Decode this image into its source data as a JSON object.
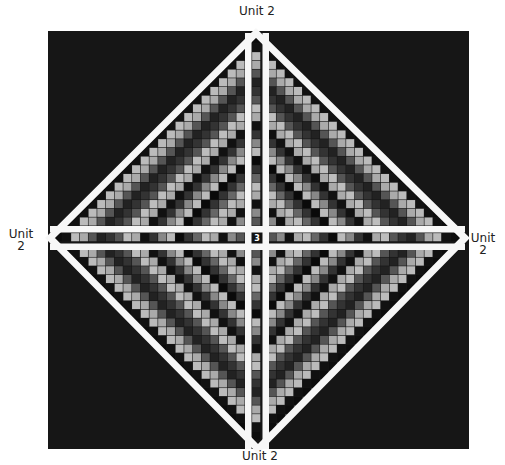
{
  "diagram": {
    "type": "quilt-layout",
    "background_color": "#161616",
    "sashing_color": "#f7f7f7",
    "center_label": "3",
    "labels": {
      "top": "Unit 2",
      "bottom": "Unit 2",
      "left_line1": "Unit",
      "left_line2": "2",
      "right_line1": "Unit",
      "right_line2": "2"
    },
    "grid": {
      "center_x": 256.5,
      "center_y": 237.5,
      "cell_size": 8.7,
      "rings": 21
    },
    "ring_palette": [
      "#0c0c0c",
      "#555555",
      "#8a8a8a",
      "#111111",
      "#aaaaaa",
      "#bcbcbc",
      "#666666",
      "#333333",
      "#0a0a0a",
      "#bbbbbb",
      "#888888",
      "#333333",
      "#111111",
      "#aaaaaa",
      "#bdbdbd",
      "#555555",
      "#333333",
      "#222222",
      "#555555",
      "#aaaaaa",
      "#bbbbbb",
      "#111111"
    ],
    "diamond": {
      "top": [
        256,
        33
      ],
      "right": [
        465,
        238
      ],
      "bottom": [
        258,
        449
      ],
      "left": [
        50,
        238
      ]
    }
  }
}
